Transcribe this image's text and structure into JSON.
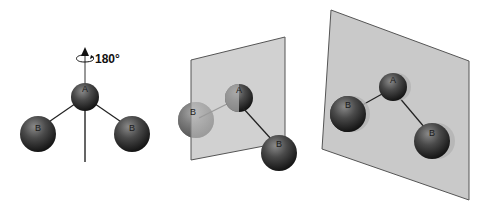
{
  "figure": {
    "rotation_label": "180°",
    "panels": [
      {
        "id": "molecule-with-c2-axis",
        "atoms": [
          {
            "label": "A",
            "role": "central"
          },
          {
            "label": "B",
            "role": "left"
          },
          {
            "label": "B",
            "role": "right"
          }
        ]
      },
      {
        "id": "molecule-with-mirror-plane-perpendicular",
        "atoms": [
          {
            "label": "A",
            "role": "central"
          },
          {
            "label": "B",
            "role": "left"
          },
          {
            "label": "B",
            "role": "right"
          }
        ]
      },
      {
        "id": "molecule-in-mirror-plane",
        "atoms": [
          {
            "label": "A",
            "role": "central"
          },
          {
            "label": "B",
            "role": "left"
          },
          {
            "label": "B",
            "role": "right"
          }
        ]
      }
    ]
  },
  "colors": {
    "atom_dark": "#1e1e1e",
    "atom_mid": "#5a5a5a",
    "plane_fill": "#c9c9c9",
    "plane_stroke": "#555555",
    "bond": "#222222"
  }
}
